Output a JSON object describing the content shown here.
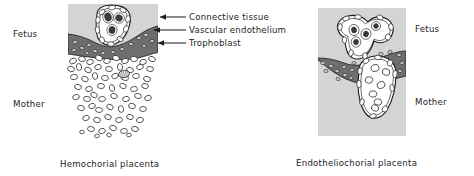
{
  "figure": {
    "panels": [
      {
        "id": "hemochorial",
        "caption": "Hemochorial placenta",
        "side_labels": {
          "fetal": "Fetus",
          "maternal": "Mother"
        },
        "callouts": [
          {
            "key": "connective_tissue",
            "label": "Connective tissue"
          },
          {
            "key": "vascular_endothelium",
            "label": "Vascular endothelium"
          },
          {
            "key": "trophoblast",
            "label": "Trophoblast"
          }
        ]
      },
      {
        "id": "endotheliochorial",
        "caption": "Endotheliochorial placenta",
        "side_labels": {
          "fetal": "Fetus",
          "maternal": "Mother"
        }
      }
    ],
    "colors": {
      "panel_background": "#d4d4d4",
      "trophoblast_band": "#6e6e6e",
      "cell_fill": "#ffffff",
      "nucleus_fill": "#3b3b3b",
      "outline": "#1b1b1b",
      "text": "#232323"
    }
  }
}
